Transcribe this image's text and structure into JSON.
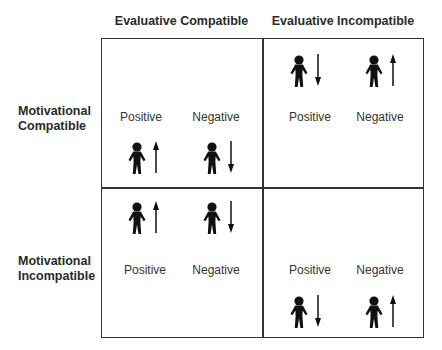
{
  "columns": [
    {
      "label": "Evaluative Compatible"
    },
    {
      "label": "Evaluative Incompatible"
    }
  ],
  "rows": [
    {
      "label_line1": "Motivational",
      "label_line2": "Compatible"
    },
    {
      "label_line1": "Motivational",
      "label_line2": "Incompatible"
    }
  ],
  "quadrants": [
    {
      "id": "motivational-compatible-evaluative-compatible",
      "layout": "labels-above-figures",
      "items": [
        {
          "label": "Positive",
          "figure": "person-icon",
          "arrow": "up"
        },
        {
          "label": "Negative",
          "figure": "person-icon",
          "arrow": "down"
        }
      ]
    },
    {
      "id": "motivational-compatible-evaluative-incompatible",
      "layout": "figures-above-labels",
      "items": [
        {
          "label": "Positive",
          "figure": "person-icon",
          "arrow": "down"
        },
        {
          "label": "Negative",
          "figure": "person-icon",
          "arrow": "up"
        }
      ]
    },
    {
      "id": "motivational-incompatible-evaluative-compatible",
      "layout": "figures-above-labels",
      "items": [
        {
          "label": "Positive",
          "figure": "person-icon",
          "arrow": "up"
        },
        {
          "label": "Negative",
          "figure": "person-icon",
          "arrow": "down"
        }
      ]
    },
    {
      "id": "motivational-incompatible-evaluative-incompatible",
      "layout": "labels-above-figures",
      "items": [
        {
          "label": "Positive",
          "figure": "person-icon",
          "arrow": "down"
        },
        {
          "label": "Negative",
          "figure": "person-icon",
          "arrow": "up"
        }
      ]
    }
  ],
  "colors": {
    "line": "#333333",
    "figure": "#111111",
    "text": "#2a2a2a"
  }
}
